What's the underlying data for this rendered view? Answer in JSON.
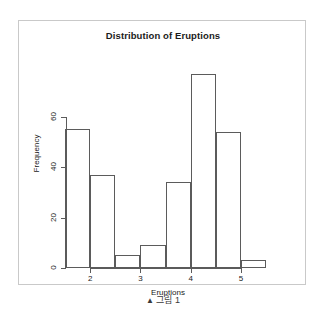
{
  "figure": {
    "caption_marker": "▲",
    "caption_text": "그림 1"
  },
  "chart_data": {
    "type": "bar",
    "title": "Distribution of Eruptions",
    "xlabel": "Eruptions",
    "ylabel": "Frequency",
    "subtitle": "",
    "grid": false,
    "legend": "none",
    "bin_width": 0.5,
    "categories": [
      "1.5–2.0",
      "2.0–2.5",
      "2.5–3.0",
      "3.0–3.5",
      "3.5–4.0",
      "4.0–4.5",
      "4.5–5.0",
      "5.0–5.5"
    ],
    "bin_edges": [
      1.5,
      2.0,
      2.5,
      3.0,
      3.5,
      4.0,
      4.5,
      5.0,
      5.5
    ],
    "values": [
      55,
      37,
      5,
      9,
      34,
      77,
      54,
      3
    ],
    "xlim": [
      1.5,
      5.5
    ],
    "ylim": [
      0,
      80
    ],
    "xticks": [
      2,
      3,
      4,
      5
    ],
    "xtick_labels": [
      "2",
      "3",
      "4",
      "5"
    ],
    "yticks": [
      0,
      20,
      40,
      60
    ],
    "ytick_labels": [
      "0",
      "20",
      "40",
      "60"
    ],
    "bar_edge_color": "#5b5b5b",
    "bar_fill_color": "none",
    "axis_color": "#5b5b5b",
    "text_color": "#1b1b1b"
  }
}
